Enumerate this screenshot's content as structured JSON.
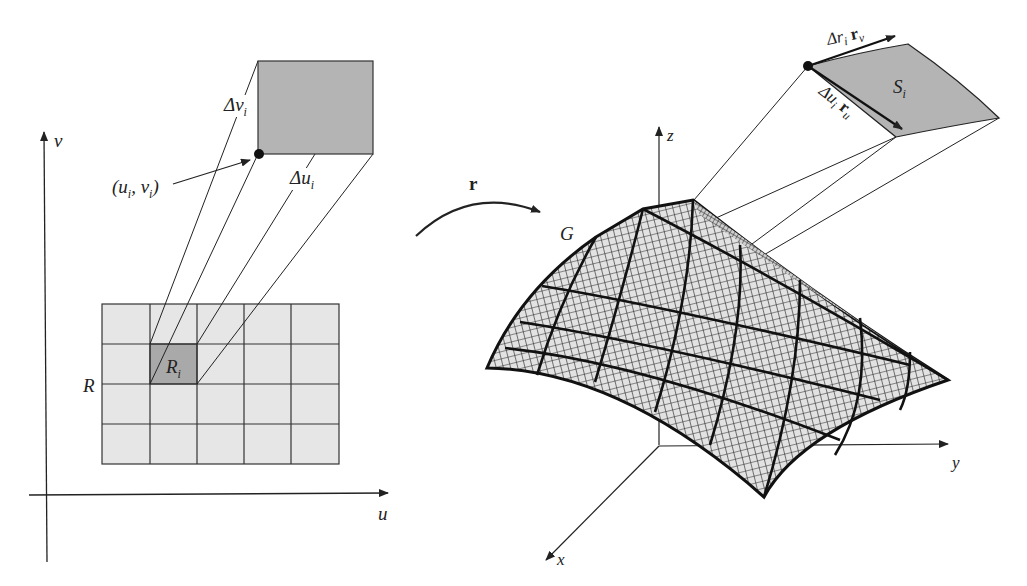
{
  "figure": {
    "left_panel": {
      "axes": {
        "horizontal": "u",
        "vertical": "v"
      },
      "region_label": "R",
      "subregion_label": "R",
      "subregion_subscript": "i",
      "grid": {
        "rows": 4,
        "cols": 5,
        "highlighted_cell": {
          "row": 1,
          "col": 1
        }
      },
      "point_label": "(u",
      "point_label_full": "(u_i, v_i)",
      "point_sub_u": "i",
      "point_mid": ", v",
      "point_sub_v": "i",
      "point_close": ")",
      "delta_v": "Δv",
      "delta_v_sub": "i",
      "delta_u": "Δu",
      "delta_u_sub": "i"
    },
    "mapping": {
      "label": "r"
    },
    "right_panel": {
      "axes": {
        "x": "x",
        "y": "y",
        "z": "z"
      },
      "surface_label": "G",
      "patch_label": "S",
      "patch_sub": "i",
      "vec_v_delta": "Δr",
      "vec_v_delta_sub": "i",
      "vec_v": "r",
      "vec_v_sub": "v",
      "vec_u_delta": "Δu",
      "vec_u_delta_sub": "i",
      "vec_u": "r",
      "vec_u_sub": "u"
    },
    "colors": {
      "grid_fill": "#e6e6e6",
      "highlight_fill": "#a9a9a9",
      "patch_fill": "#b4b4b4",
      "surface_fill": "#e2e2e2",
      "ink": "#222222"
    }
  }
}
